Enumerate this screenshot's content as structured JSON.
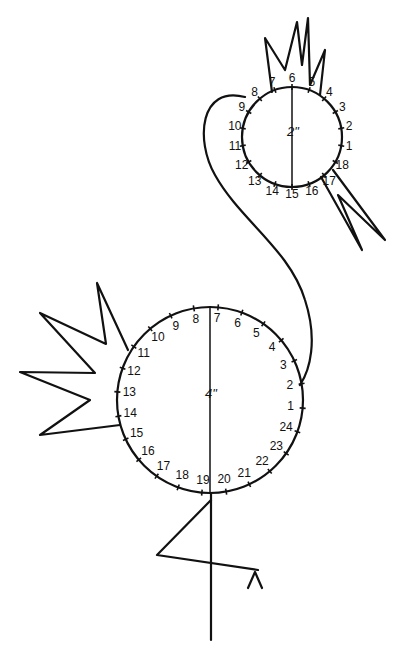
{
  "diagram": {
    "title": "",
    "head": {
      "diameter_label": "2\"",
      "numbers": [
        "1",
        "2",
        "3",
        "4",
        "5",
        "6",
        "7",
        "8",
        "9",
        "10",
        "11",
        "12",
        "13",
        "14",
        "15",
        "16",
        "17",
        "18"
      ]
    },
    "body": {
      "diameter_label": "4\"",
      "numbers": [
        "1",
        "2",
        "3",
        "4",
        "5",
        "6",
        "7",
        "8",
        "9",
        "10",
        "11",
        "12",
        "13",
        "14",
        "15",
        "16",
        "17",
        "18",
        "19",
        "20",
        "21",
        "22",
        "23",
        "24"
      ]
    },
    "parts": [
      "crest",
      "head-circle",
      "beak",
      "neck",
      "body-circle",
      "wing",
      "leg",
      "foot"
    ],
    "line_color": "#111111",
    "background": "#ffffff"
  }
}
